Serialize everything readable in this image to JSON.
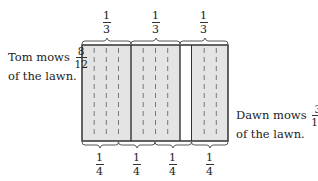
{
  "diagram": {
    "type": "fraction-area-model",
    "colors": {
      "shaded": "#e4e4e4",
      "unshaded": "#ffffff",
      "outline": "#333333",
      "dash": "#666666"
    },
    "total_parts": 12,
    "shaded_parts_tom": [
      1,
      2,
      3,
      4,
      5,
      6,
      7,
      8
    ],
    "unshaded_parts": [
      9
    ],
    "shaded_parts_dawn": [
      10,
      11,
      12
    ],
    "top_labels": [
      {
        "num": "1",
        "den": "3"
      },
      {
        "num": "1",
        "den": "3"
      },
      {
        "num": "1",
        "den": "3"
      }
    ],
    "bottom_labels": [
      {
        "num": "1",
        "den": "4"
      },
      {
        "num": "1",
        "den": "4"
      },
      {
        "num": "1",
        "den": "4"
      },
      {
        "num": "1",
        "den": "4"
      }
    ],
    "tom": {
      "line1_prefix": "Tom mows",
      "fraction": {
        "num": "8",
        "den": "12"
      },
      "line2": "of the lawn."
    },
    "dawn": {
      "line1_prefix": "Dawn mows",
      "fraction": {
        "num": "3",
        "den": "12"
      },
      "line2": "of the lawn."
    }
  }
}
